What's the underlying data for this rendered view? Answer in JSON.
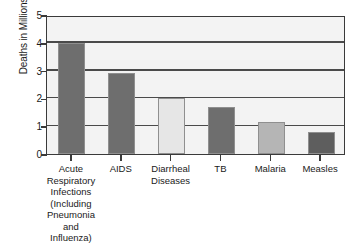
{
  "chart_data": {
    "type": "bar",
    "title": "",
    "xlabel": "",
    "ylabel": "Deaths in Millions",
    "ylim": [
      0,
      5
    ],
    "ytick_labels": [
      "5",
      "4",
      "3",
      "2",
      "1",
      "0"
    ],
    "ytick_values": [
      5,
      4,
      3,
      2,
      1,
      0
    ],
    "grid": true,
    "legend": "none",
    "categories": [
      "Acute\nRespiratory\nInfections\n(Including\nPneumonia and\nInfluenza)",
      "AIDS",
      "Diarrheal\nDiseases",
      "TB",
      "Malaria",
      "Measles"
    ],
    "values": [
      4.0,
      2.9,
      2.0,
      1.7,
      1.15,
      0.8
    ],
    "bar_colors": [
      "#6e6e6e",
      "#6e6e6e",
      "#e6e6e6",
      "#6e6e6e",
      "#b5b5b5",
      "#5e5e5e"
    ]
  },
  "style": {
    "plot_background": "#f3f3f3",
    "axis_color": "#3a3a3a",
    "gridline_color": "#4a4a4a",
    "page_background": "#ffffff"
  }
}
